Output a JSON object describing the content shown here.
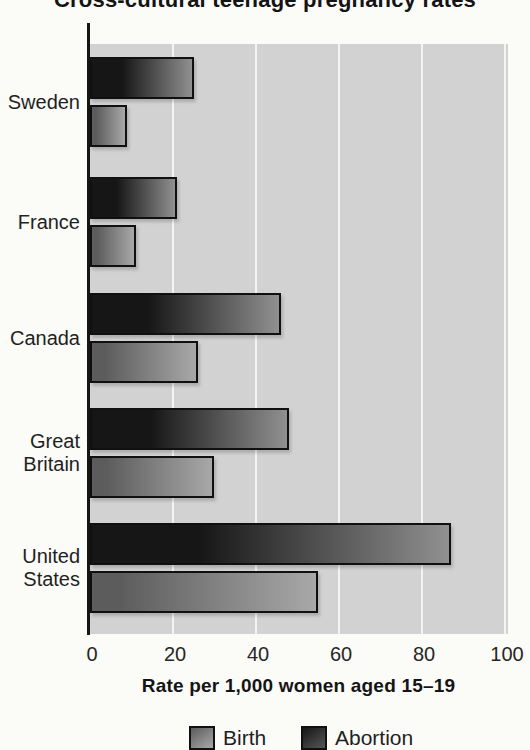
{
  "chart_data": {
    "type": "bar",
    "orientation": "horizontal",
    "title": "Cross-cultural teenage pregnancy rates",
    "title_note": "title is clipped at the top edge of the image",
    "categories": [
      "Sweden",
      "France",
      "Canada",
      "Great Britain",
      "United States"
    ],
    "series": [
      {
        "name": "Abortion",
        "position": "top-bar-of-pair",
        "shade": "dark",
        "values": [
          24,
          20,
          45,
          47,
          86
        ]
      },
      {
        "name": "Birth",
        "position": "bottom-bar-of-pair",
        "shade": "gray",
        "values": [
          8,
          10,
          25,
          29,
          54
        ]
      }
    ],
    "xlabel": "Rate per 1,000 women aged 15–19",
    "x_ticks": [
      0,
      20,
      40,
      60,
      80,
      100
    ],
    "xlim": [
      0,
      100
    ],
    "grid": "vertical white gridlines at major ticks",
    "legend_position": "bottom",
    "legend_items": [
      {
        "label": "Birth",
        "swatch": "gray-gradient"
      },
      {
        "label": "Abortion",
        "swatch": "dark-gradient"
      }
    ]
  },
  "colors": {
    "page_background": "#fbfbf8",
    "plot_background": "#d2d2d2",
    "gridline": "#f4f4f1",
    "axis": "#161616",
    "bar_border": "#101010",
    "abortion_bar_start": "#161616",
    "abortion_bar_end": "#909090",
    "birth_bar_start": "#5c5c5c",
    "birth_bar_end": "#a8a8a8",
    "text": "#1f1f1f"
  }
}
